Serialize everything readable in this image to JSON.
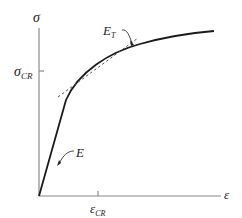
{
  "diagram": {
    "type": "stress-strain curve",
    "y_axis": {
      "label": "σ",
      "tick_label": "σ",
      "tick_subscript": "CR"
    },
    "x_axis": {
      "label": "ε",
      "tick_label": "ε",
      "tick_subscript": "CR"
    },
    "annotations": {
      "elastic_modulus": "E",
      "tangent_modulus": "E",
      "tangent_modulus_subscript": "T"
    },
    "colors": {
      "axis": "#8a8a8a",
      "curve": "#1a1a1a",
      "text": "#222222"
    }
  }
}
